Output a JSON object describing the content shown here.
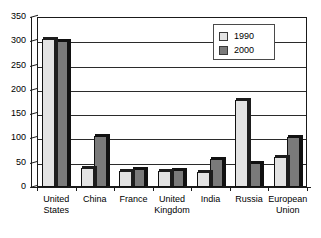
{
  "chart_data": {
    "type": "bar",
    "title": "",
    "subtitle": "",
    "xlabel": "",
    "ylabel": "",
    "ylim": [
      0,
      350
    ],
    "ytick_step": 50,
    "yticks": [
      "350",
      "300",
      "250",
      "200",
      "150",
      "100",
      "50",
      "0"
    ],
    "grid": true,
    "legend_position": "top-right",
    "categories": [
      "United States",
      "China",
      "France",
      "United Kingdom",
      "India",
      "Russia",
      "European Union"
    ],
    "category_lines": [
      [
        "United",
        "States"
      ],
      [
        "China",
        ""
      ],
      [
        "France",
        ""
      ],
      [
        "United",
        "Kingdom"
      ],
      [
        "India",
        ""
      ],
      [
        "Russia",
        ""
      ],
      [
        "European",
        "Union"
      ]
    ],
    "series": [
      {
        "name": "1990",
        "color": "#e3e3e3",
        "values": [
          305,
          40,
          32,
          33,
          31,
          180,
          62
        ]
      },
      {
        "name": "2000",
        "color": "#7a7a7a",
        "values": [
          300,
          105,
          37,
          36,
          58,
          50,
          103
        ]
      }
    ]
  },
  "legend": {
    "entries": [
      {
        "label": "1990",
        "swatch": "legend-swatch-1990"
      },
      {
        "label": "2000",
        "swatch": "legend-swatch-2000"
      }
    ]
  },
  "colors": {
    "series_1990": "#e3e3e3",
    "series_2000": "#7a7a7a",
    "axis": "#1a1a1a",
    "grid": "#2b2b2b",
    "background": "#ffffff",
    "text": "#000000"
  }
}
